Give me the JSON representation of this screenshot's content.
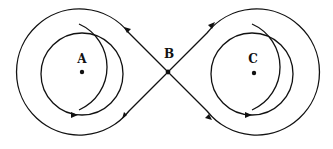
{
  "diagram": {
    "title": "",
    "labels": {
      "A": "A",
      "B": "B",
      "C": "C"
    },
    "points": {
      "A": {
        "x": 82,
        "y": 72
      },
      "B": {
        "x": 168,
        "y": 72
      },
      "C": {
        "x": 254,
        "y": 73
      }
    },
    "colors": {
      "line": "#111111",
      "background": "#ffffff"
    }
  }
}
